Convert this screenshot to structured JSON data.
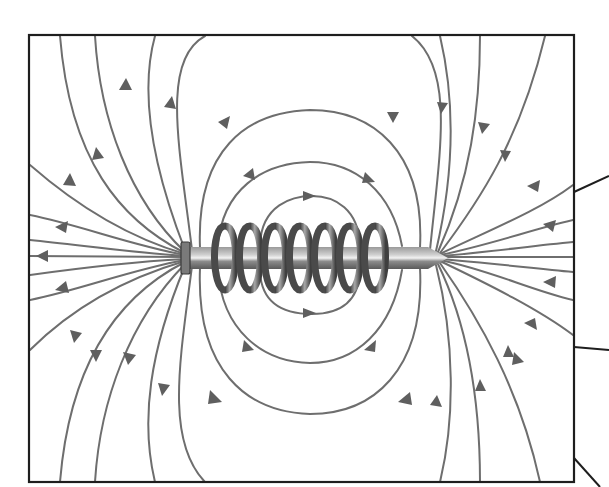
{
  "diagram": {
    "title": "",
    "colors": {
      "background": "#ffffff",
      "frame": "#1e1e1e",
      "field_lines": "#6e6e6e",
      "arrowheads": "#5f5f5f",
      "nail": "#8a8a8a",
      "coil": "#6a6a6a"
    },
    "frame": {
      "x": 29,
      "y": 35,
      "width": 545,
      "height": 447
    },
    "nail": {
      "head_side": "left",
      "point_side": "right",
      "x_start": 181,
      "x_end": 448,
      "center_y": 258
    },
    "coil": {
      "turns": 7,
      "x_start": 212,
      "x_end": 392
    },
    "field": {
      "exits_at": "nail head (left end)",
      "enters_at": "nail point (right end)",
      "closed_loops_above": 3,
      "closed_loops_below": 3,
      "arrow_direction_left_side": "outward (away from nail)",
      "arrow_direction_right_side": "inward (toward nail)",
      "arrow_direction_loops": "left-to-right"
    },
    "leader_lines": [
      {
        "from": [
          574,
          192
        ],
        "to": [
          609,
          176
        ]
      },
      {
        "from": [
          574,
          347
        ],
        "to": [
          609,
          350
        ]
      },
      {
        "from": [
          574,
          458
        ],
        "to": [
          600,
          487
        ]
      }
    ],
    "labels": []
  }
}
